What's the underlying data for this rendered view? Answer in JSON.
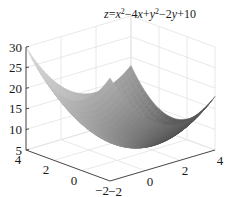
{
  "chart_data": {
    "type": "surface",
    "title_parts": [
      {
        "text": "z",
        "italic": true
      },
      {
        "text": "=",
        "italic": false
      },
      {
        "text": "x",
        "italic": true
      },
      {
        "text": "2",
        "sup": true
      },
      {
        "text": "−4",
        "italic": false
      },
      {
        "text": "x",
        "italic": true
      },
      {
        "text": "+",
        "italic": false
      },
      {
        "text": "y",
        "italic": true
      },
      {
        "text": "2",
        "sup": true
      },
      {
        "text": "−2",
        "italic": false
      },
      {
        "text": "y",
        "italic": true
      },
      {
        "text": "+10",
        "italic": false
      }
    ],
    "function": "x^2 - 4*x + y^2 - 2*y + 10",
    "coefficients": {
      "x2": 1,
      "x": -4,
      "y2": 1,
      "y": -2,
      "c": 10
    },
    "xlim": [
      -2,
      4
    ],
    "ylim": [
      -2,
      4
    ],
    "zlim": [
      5,
      30
    ],
    "xticks": [
      -2,
      0,
      2,
      4
    ],
    "yticks": [
      -2,
      0,
      2,
      4
    ],
    "zticks": [
      5,
      10,
      15,
      20,
      25,
      30
    ],
    "xtick_labels": [
      "−2",
      "0",
      "2",
      "4"
    ],
    "ytick_labels": [
      "−2",
      "0",
      "2",
      "4"
    ],
    "ztick_labels": [
      "5",
      "10",
      "15",
      "20",
      "25",
      "30"
    ],
    "xlabel": "",
    "ylabel": "",
    "zlabel": "",
    "grid": true,
    "colormap": "gray",
    "shading": "interp",
    "legend": "none"
  },
  "colors": {
    "axis": "#3a3a3a",
    "grid": "#e2e2e2",
    "text": "#1a1a1a"
  }
}
